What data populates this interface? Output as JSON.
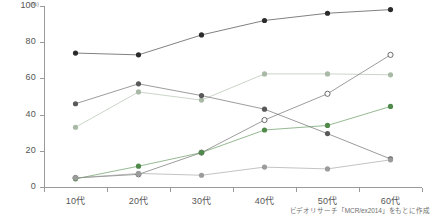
{
  "chart_data": {
    "type": "line",
    "title": "",
    "subtitle": "",
    "xlabel": "",
    "ylabel": "",
    "unit_label": "(%)",
    "categories": [
      "10代",
      "20代",
      "30代",
      "40代",
      "50代",
      "60代"
    ],
    "ylim": [
      0,
      100
    ],
    "y_ticks": [
      0,
      20,
      40,
      60,
      80,
      100
    ],
    "grid": false,
    "legend": "none",
    "series": [
      {
        "name": "series-1-dark",
        "color": "#2b2b2b",
        "marker": "filled-circle",
        "values": [
          74,
          73,
          84,
          92,
          96,
          98
        ]
      },
      {
        "name": "series-2-pale-green",
        "color": "#a8b9a5",
        "marker": "filled-circle",
        "values": [
          33,
          52.5,
          48,
          62.5,
          62.5,
          62
        ]
      },
      {
        "name": "series-3-dark-gray",
        "color": "#595959",
        "marker": "filled-circle",
        "values": [
          46,
          57,
          50.5,
          43,
          29.5,
          15.5
        ]
      },
      {
        "name": "series-4-open-circle",
        "color": "#5a5a5a",
        "marker": "open-circle",
        "values": [
          5,
          7,
          19,
          37,
          51.5,
          73
        ]
      },
      {
        "name": "series-5-green",
        "color": "#4f8a4a",
        "marker": "filled-circle",
        "values": [
          4.5,
          11.5,
          19,
          31.5,
          34,
          44.5
        ]
      },
      {
        "name": "series-6-mid-gray",
        "color": "#9b9b9b",
        "marker": "filled-circle",
        "values": [
          5,
          7.5,
          6.5,
          11,
          10,
          15
        ]
      }
    ]
  },
  "axis": {
    "y_tick_labels": [
      "0",
      "20",
      "40",
      "60",
      "80",
      "100"
    ],
    "x_tick_labels": [
      "10代",
      "20代",
      "30代",
      "40代",
      "50代",
      "60代"
    ]
  },
  "source": {
    "note": "ビデオリサーチ「MCR/ex2014」をもとに作成"
  },
  "colors": {
    "axis": "#9a9a9a",
    "text": "#555555",
    "background": "#ffffff"
  }
}
